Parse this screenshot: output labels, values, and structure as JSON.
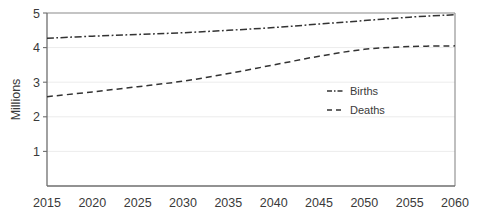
{
  "chart_data": {
    "type": "line",
    "title": "",
    "xlabel": "",
    "ylabel": "Millions",
    "xlim": [
      2015,
      2060
    ],
    "ylim": [
      0,
      5
    ],
    "yticks": [
      1,
      2,
      3,
      4,
      5
    ],
    "xticks": [
      2015,
      2020,
      2025,
      2030,
      2035,
      2040,
      2045,
      2050,
      2055,
      2060
    ],
    "grid": true,
    "legend_position": "center-right",
    "x": [
      2015,
      2020,
      2025,
      2030,
      2035,
      2040,
      2045,
      2050,
      2055,
      2060
    ],
    "series": [
      {
        "name": "Births",
        "style": "dash-dot",
        "color": "#333333",
        "values": [
          4.27,
          4.33,
          4.38,
          4.43,
          4.5,
          4.58,
          4.68,
          4.78,
          4.88,
          4.95
        ]
      },
      {
        "name": "Deaths",
        "style": "dashed",
        "color": "#333333",
        "values": [
          2.58,
          2.72,
          2.87,
          3.03,
          3.25,
          3.5,
          3.75,
          3.95,
          4.03,
          4.05
        ]
      }
    ]
  },
  "axis": {
    "y_title": "Millions",
    "y_tick_labels": [
      "5",
      "4",
      "3",
      "2",
      "1"
    ],
    "x_tick_labels": [
      "2015",
      "2020",
      "2025",
      "2030",
      "2035",
      "2040",
      "2045",
      "2050",
      "2055",
      "2060"
    ]
  },
  "legend": {
    "items": [
      {
        "label": "Births"
      },
      {
        "label": "Deaths"
      }
    ]
  },
  "colors": {
    "line": "#333333",
    "axis": "#808080",
    "grid": "#e8e8e8",
    "text": "#3a3a3a",
    "background": "#ffffff"
  }
}
